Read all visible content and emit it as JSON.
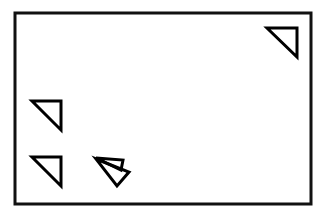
{
  "figure": {
    "title": "Line drawing of a rectangular frame containing right triangles",
    "width": 322,
    "height": 217,
    "background_color": "#ffffff",
    "ink_color": "#000000"
  },
  "frame": {
    "name": "outer-rectangle",
    "x": 15,
    "y": 13,
    "width": 296,
    "height": 191,
    "stroke_color": "#111111",
    "stroke_width": 3
  },
  "shapes": [
    {
      "name": "triangle-top-right",
      "label": "Top-right triangle",
      "points": "267,28 297,28 297,57",
      "right_angle_at": "top-right",
      "stroke_color": "#000000",
      "stroke_width": 3
    },
    {
      "name": "triangle-left-middle",
      "label": "Left-middle triangle",
      "points": "32,101 61,101 61,130",
      "right_angle_at": "top-right",
      "stroke_color": "#000000",
      "stroke_width": 3
    },
    {
      "name": "triangle-bottom-left",
      "label": "Bottom-left triangle",
      "points": "32,157 61,157 61,186",
      "right_angle_at": "top-right",
      "stroke_color": "#000000",
      "stroke_width": 3
    },
    {
      "name": "triangle-center-thin",
      "label": "Center thin sliver triangle",
      "points": "96,158 123,160 121,170",
      "right_angle_at": "none",
      "stroke_color": "#000000",
      "stroke_width": 3
    },
    {
      "name": "triangle-center-large",
      "label": "Center overlapping triangle",
      "points": "96,159 129,172 117,186",
      "right_angle_at": "none",
      "stroke_color": "#000000",
      "stroke_width": 3
    }
  ]
}
